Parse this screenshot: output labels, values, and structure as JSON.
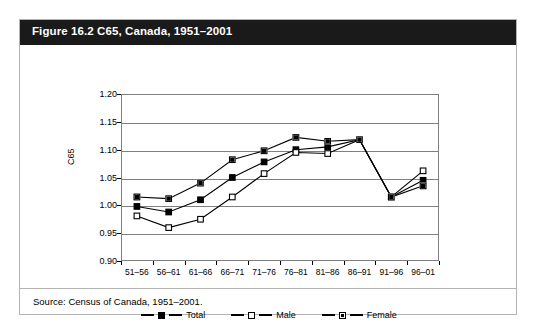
{
  "figure": {
    "title": "Figure 16.2 C65, Canada, 1951–2001",
    "source": "Source: Census of Canada, 1951–2001."
  },
  "chart_data": {
    "type": "line",
    "title": "Figure 16.2 C65, Canada, 1951–2001",
    "xlabel": "",
    "ylabel": "C65",
    "categories": [
      "51–56",
      "56–61",
      "61–66",
      "66–71",
      "71–76",
      "76–81",
      "81–86",
      "86–91",
      "91–96",
      "96–01"
    ],
    "ylim": [
      0.9,
      1.2
    ],
    "ytick_labels": [
      "1.20",
      "1.15",
      "1.10",
      "1.05",
      "1.00",
      "0.95",
      "0.90"
    ],
    "ytick_values": [
      1.2,
      1.15,
      1.1,
      1.05,
      1.0,
      0.95,
      0.9
    ],
    "grid": true,
    "legend_position": "bottom",
    "series": [
      {
        "name": "Total",
        "marker": "filled-square",
        "values": [
          0.998,
          0.988,
          1.01,
          1.05,
          1.078,
          1.1,
          1.105,
          1.118,
          1.015,
          1.045
        ]
      },
      {
        "name": "Male",
        "marker": "open-square",
        "values": [
          0.981,
          0.96,
          0.975,
          1.015,
          1.057,
          1.095,
          1.093,
          1.118,
          1.015,
          1.062
        ]
      },
      {
        "name": "Female",
        "marker": "half-filled-square",
        "values": [
          1.015,
          1.012,
          1.04,
          1.082,
          1.098,
          1.122,
          1.115,
          1.118,
          1.015,
          1.035
        ]
      }
    ]
  }
}
